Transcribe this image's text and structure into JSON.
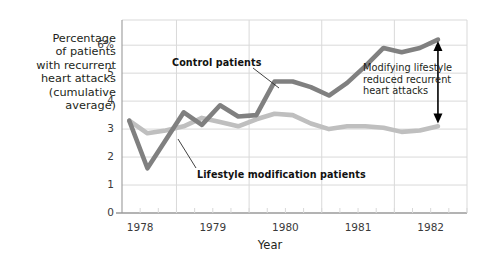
{
  "chart_data": {
    "type": "line",
    "title": "",
    "xlabel": "Year",
    "ylabel": "Percentage of patients with recurrent heart attacks (cumulative average)",
    "ylabel_lines": [
      "Percentage",
      "of patients",
      "with recurrent",
      "heart attacks",
      "(cumulative",
      "average)"
    ],
    "xlim": [
      1977.75,
      1982.5
    ],
    "ylim": [
      0,
      6.9
    ],
    "grid": true,
    "legend_position": "inline-annotations",
    "y_ticks": [
      {
        "value": 0,
        "label": "0"
      },
      {
        "value": 1,
        "label": "1"
      },
      {
        "value": 2,
        "label": "2"
      },
      {
        "value": 3,
        "label": "3"
      },
      {
        "value": 4,
        "label": "4"
      },
      {
        "value": 5,
        "label": "5"
      },
      {
        "value": 6,
        "label": "6%"
      }
    ],
    "x_ticks": [
      {
        "value": 1978,
        "label": "1978"
      },
      {
        "value": 1979,
        "label": "1979"
      },
      {
        "value": 1980,
        "label": "1980"
      },
      {
        "value": 1981,
        "label": "1981"
      },
      {
        "value": 1982,
        "label": "1982"
      }
    ],
    "x_minor_tick_interval": 0.25,
    "x_gridlines": [
      1978.5,
      1979.5,
      1980.5,
      1981.5
    ],
    "series": [
      {
        "name": "Control patients",
        "color": "#808080",
        "x": [
          1977.85,
          1978.1,
          1978.35,
          1978.6,
          1978.85,
          1979.1,
          1979.35,
          1979.6,
          1979.85,
          1980.1,
          1980.35,
          1980.6,
          1980.85,
          1981.1,
          1981.35,
          1981.6,
          1981.85,
          1982.1
        ],
        "values": [
          3.3,
          1.6,
          2.6,
          3.6,
          3.15,
          3.85,
          3.45,
          3.5,
          4.7,
          4.7,
          4.5,
          4.2,
          4.65,
          5.25,
          5.9,
          5.75,
          5.9,
          6.2
        ]
      },
      {
        "name": "Lifestyle modification patients",
        "color": "#bfbfbf",
        "x": [
          1977.85,
          1978.1,
          1978.35,
          1978.6,
          1978.85,
          1979.1,
          1979.35,
          1979.6,
          1979.85,
          1980.1,
          1980.35,
          1980.6,
          1980.85,
          1981.1,
          1981.35,
          1981.6,
          1981.85,
          1982.1
        ],
        "values": [
          3.3,
          2.85,
          2.95,
          3.1,
          3.4,
          3.25,
          3.1,
          3.35,
          3.55,
          3.5,
          3.2,
          3.0,
          3.1,
          3.1,
          3.05,
          2.9,
          2.95,
          3.1
        ]
      }
    ],
    "annotations": [
      {
        "name": "control-series-label",
        "text": "Control patients",
        "lines": [
          "Control patients"
        ]
      },
      {
        "name": "lifestyle-series-label",
        "text": "Lifestyle modification patients",
        "lines": [
          "Lifestyle modification patients"
        ]
      },
      {
        "name": "gap-annotation",
        "lines": [
          "Modifying lifestyle",
          "reduced recurrent",
          "heart attacks"
        ]
      }
    ],
    "gap_arrow": {
      "x": 1982.1,
      "y_top": 6.15,
      "y_bottom": 3.2
    }
  },
  "colors": {
    "control_line": "#808080",
    "lifestyle_line": "#bfbfbf",
    "grid": "#d9d9d9",
    "axis": "#9a9a9a",
    "text": "#231f20",
    "arrow": "#000000",
    "background": "#ffffff"
  }
}
